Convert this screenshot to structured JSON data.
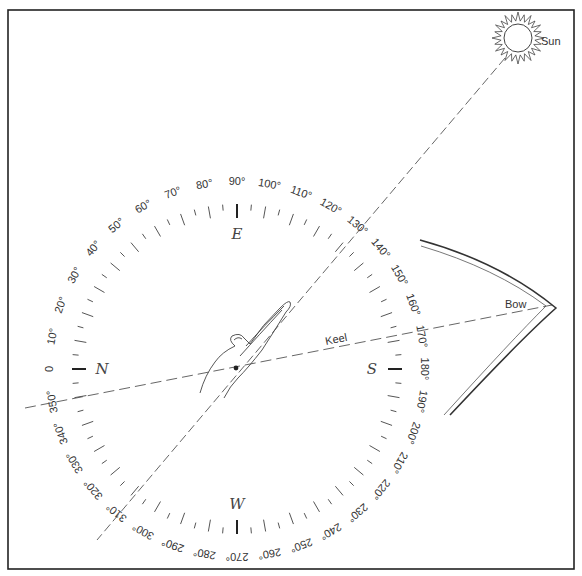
{
  "diagram": {
    "frame": {
      "x": 8,
      "y": 10,
      "width": 566,
      "height": 559,
      "stroke": "#222"
    },
    "compass": {
      "center": [
        237,
        369
      ],
      "tick_radius": 165,
      "label_radius": 188,
      "degree_labels": [
        "0",
        "10°",
        "20°",
        "30°",
        "40°",
        "50°",
        "60°",
        "70°",
        "80°",
        "90°",
        "100°",
        "110°",
        "120°",
        "130°",
        "140°",
        "150°",
        "160°",
        "170°",
        "180°",
        "190°",
        "200°",
        "210°",
        "220°",
        "230°",
        "240°",
        "250°",
        "260°",
        "270°",
        "280°",
        "290°",
        "300°",
        "310°",
        "320°",
        "330°",
        "340°",
        "350°"
      ],
      "cardinals": [
        {
          "bearing": 0,
          "letter": "N"
        },
        {
          "bearing": 90,
          "letter": "E"
        },
        {
          "bearing": 180,
          "letter": "S"
        },
        {
          "bearing": 270,
          "letter": "W"
        }
      ]
    },
    "sun": {
      "label": "Sun",
      "center": [
        518,
        38
      ],
      "radius": 14
    },
    "keel": {
      "label": "Keel"
    },
    "bow": {
      "label": "Bow"
    },
    "hand": {
      "description": "pointing hand aligned with sun line"
    },
    "colors": {
      "ink": "#333333",
      "background": "#ffffff"
    }
  }
}
